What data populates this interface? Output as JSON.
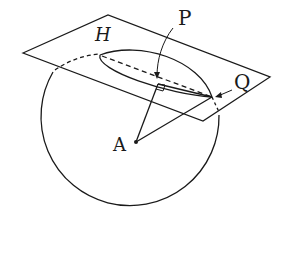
{
  "diagram": {
    "type": "sphere-plane-intersection",
    "labels": {
      "P": "P",
      "H": "H",
      "Q": "Q",
      "A": "A"
    },
    "stroke_color": "#1a1a1a",
    "background": "#ffffff"
  }
}
